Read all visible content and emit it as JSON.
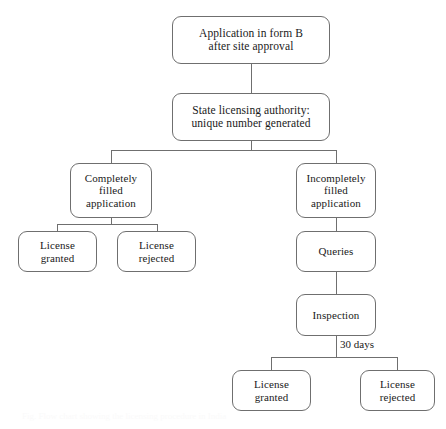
{
  "diagram": {
    "background_color": "#ffffff",
    "line_color": "#6f6f6f",
    "text_color": "#1a1a1a",
    "nodes": {
      "application": "Application in form B\nafter site approval",
      "state_authority": "State  licensing authority:\nunique number generated",
      "completely_filled": "Completely\nfilled\napplication",
      "incompletely_filled": "Incompletely\nfilled\napplication",
      "license_granted_left": "License\ngranted",
      "license_rejected_left": "License\nrejected",
      "queries": "Queries",
      "inspection": "Inspection",
      "license_granted_bottom": "License\ngranted",
      "license_rejected_bottom": "License\nrejected"
    },
    "edge_labels": {
      "thirty_days": "30 days"
    },
    "caption": "Fig. Flow chart showing the licensing procedure in India"
  }
}
